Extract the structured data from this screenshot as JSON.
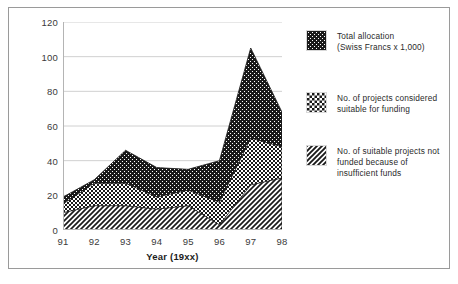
{
  "figure": {
    "border_color": "#9a9a9a",
    "background": "#ffffff"
  },
  "axis": {
    "x_title": "Year (19xx)",
    "y_ticks": [
      "0",
      "20",
      "40",
      "60",
      "80",
      "100",
      "120"
    ],
    "x_ticks": [
      "91",
      "92",
      "93",
      "94",
      "95",
      "96",
      "97",
      "98"
    ]
  },
  "legend": {
    "items": [
      {
        "name": "total-allocation",
        "pattern": "dotted-black",
        "color": "#1a1a1a",
        "line1": "Total allocation",
        "line2": "(Swiss Francs x 1,000)",
        "line3": ""
      },
      {
        "name": "projects-considered-suitable",
        "pattern": "checkerboard",
        "color": "#1a1a1a",
        "line1": "No. of projects considered",
        "line2": "suitable for funding",
        "line3": ""
      },
      {
        "name": "suitable-not-funded",
        "pattern": "diagonal-hatch",
        "color": "#1a1a1a",
        "line1": "No. of suitable projects not",
        "line2": "funded because of",
        "line3": "insufficient funds"
      }
    ]
  },
  "chart_data": {
    "type": "area",
    "title": "",
    "xlabel": "Year (19xx)",
    "ylabel": "",
    "xlim": [
      91,
      98
    ],
    "ylim": [
      0,
      120
    ],
    "grid": true,
    "legend_position": "right",
    "stacked": false,
    "categories": [
      "91",
      "92",
      "93",
      "94",
      "95",
      "96",
      "97",
      "98"
    ],
    "series": [
      {
        "name": "Total allocation (Swiss Francs x 1,000)",
        "pattern": "dotted-black",
        "values": [
          19,
          29,
          46,
          36,
          35,
          40,
          105,
          68
        ]
      },
      {
        "name": "No. of projects considered suitable for funding",
        "pattern": "checkerboard",
        "values": [
          15,
          27,
          27,
          19,
          23,
          16,
          53,
          48
        ]
      },
      {
        "name": "No. of suitable projects not funded because of insufficient funds",
        "pattern": "diagonal-hatch",
        "values": [
          10,
          14,
          14,
          12,
          14,
          3,
          26,
          30
        ]
      }
    ]
  }
}
